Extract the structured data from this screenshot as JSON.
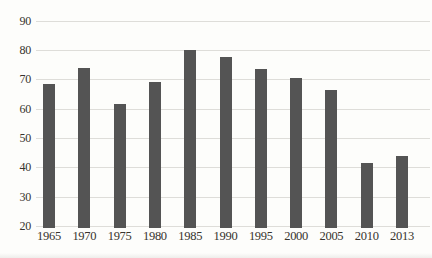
{
  "chart_data": {
    "type": "bar",
    "title": "",
    "xlabel": "",
    "ylabel": "",
    "categories": [
      "1965",
      "1970",
      "1975",
      "1980",
      "1985",
      "1990",
      "1995",
      "2000",
      "2005",
      "2010",
      "2013"
    ],
    "values": [
      68.5,
      74,
      61.5,
      69,
      80,
      77.5,
      73.5,
      70.5,
      66.5,
      41.5,
      44
    ],
    "ylim": [
      20,
      90
    ],
    "yticks": [
      20,
      30,
      40,
      50,
      60,
      70,
      80,
      90
    ],
    "grid": true,
    "legend": false,
    "bar_color": "#545454",
    "gridline_color": "#dcdbd7",
    "text_color": "#37332e",
    "background_color": "#fdfdfb"
  }
}
